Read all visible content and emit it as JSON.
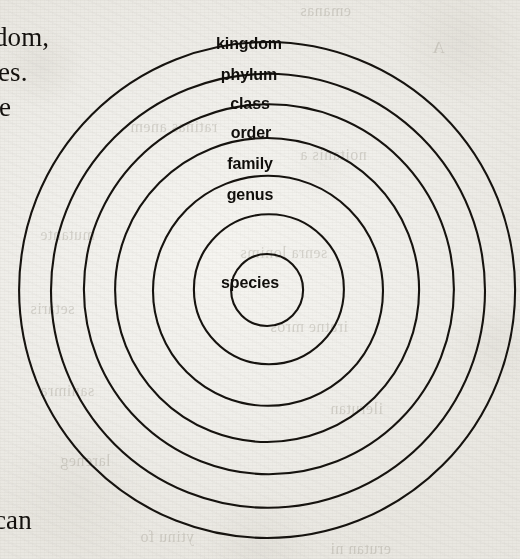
{
  "page": {
    "width": 520,
    "height": 559,
    "background_color": "#f1f0ec",
    "ink_color": "#16130f",
    "medium": "scanned book page"
  },
  "diagram": {
    "type": "concentric-circles",
    "name": "taxonomic-hierarchy-diagram",
    "center": {
      "x": 268,
      "y": 290
    },
    "rings": [
      {
        "label": "kingdom",
        "level": 1,
        "radius": 248,
        "label_x": 249,
        "label_y": 44,
        "font_size": 16
      },
      {
        "label": "phylum",
        "level": 2,
        "radius": 217,
        "label_x": 249,
        "label_y": 75,
        "font_size": 16
      },
      {
        "label": "class",
        "level": 3,
        "radius": 185,
        "label_x": 250,
        "label_y": 104,
        "font_size": 16
      },
      {
        "label": "order",
        "level": 4,
        "radius": 152,
        "label_x": 251,
        "label_y": 133,
        "font_size": 16
      },
      {
        "label": "family",
        "level": 5,
        "radius": 115,
        "label_x": 250,
        "label_y": 164,
        "font_size": 16
      },
      {
        "label": "genus",
        "level": 6,
        "radius": 75,
        "label_x": 250,
        "label_y": 195,
        "font_size": 16
      },
      {
        "label": "species",
        "level": 7,
        "radius": 36,
        "label_x": 250,
        "label_y": 283,
        "font_size": 16
      }
    ]
  },
  "body_text": {
    "fragments": [
      {
        "name": "fragment-kingdom",
        "text": "dom,",
        "x": -6,
        "y": 22,
        "font_size": 27
      },
      {
        "name": "fragment-es",
        "text": "es.",
        "x": -2,
        "y": 57,
        "font_size": 27
      },
      {
        "name": "fragment-e",
        "text": "e",
        "x": -1,
        "y": 92,
        "font_size": 27
      },
      {
        "name": "fragment-can",
        "text": "can",
        "x": -6,
        "y": 505,
        "font_size": 27
      }
    ]
  },
  "show_through": {
    "description": "Faint mirrored text bleeding through from the reverse side of the paper",
    "fragments": [
      {
        "text": "emanas",
        "x": 300,
        "y": 2,
        "font_size": 16
      },
      {
        "text": "A",
        "x": 432,
        "y": 38,
        "font_size": 17
      },
      {
        "text": "ratinas anem",
        "x": 130,
        "y": 118,
        "font_size": 16
      },
      {
        "text": "noitanis a",
        "x": 300,
        "y": 146,
        "font_size": 16
      },
      {
        "text": "mutante",
        "x": 40,
        "y": 226,
        "font_size": 16
      },
      {
        "text": "senra lonims",
        "x": 240,
        "y": 244,
        "font_size": 16
      },
      {
        "text": "setaris",
        "x": 30,
        "y": 300,
        "font_size": 16
      },
      {
        "text": "iratne mros",
        "x": 270,
        "y": 318,
        "font_size": 16
      },
      {
        "text": "sanimra",
        "x": 40,
        "y": 382,
        "font_size": 16
      },
      {
        "text": "ilerutan",
        "x": 330,
        "y": 400,
        "font_size": 16
      },
      {
        "text": "lareneg",
        "x": 60,
        "y": 452,
        "font_size": 16
      },
      {
        "text": "ytinu fo",
        "x": 140,
        "y": 528,
        "font_size": 16
      },
      {
        "text": "erutan ni",
        "x": 330,
        "y": 540,
        "font_size": 16
      }
    ]
  }
}
